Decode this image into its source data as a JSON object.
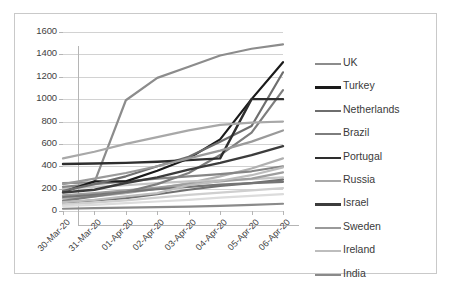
{
  "chart_data": {
    "type": "line",
    "title": "",
    "xlabel": "",
    "ylabel": "",
    "ylim": [
      0,
      1600
    ],
    "ytick_step": 200,
    "grid": true,
    "legend_position": "right",
    "yticks": [
      "1600",
      "1400",
      "1200",
      "1000",
      "800",
      "600",
      "400",
      "200",
      "0"
    ],
    "categories": [
      "30-Mar-20",
      "31-Mar-20",
      "01-Apr-20",
      "02-Apr-20",
      "03-Apr-20",
      "04-Apr-20",
      "05-Apr-20",
      "06-Apr-20"
    ],
    "series": [
      {
        "name": "UK",
        "color": "#8c8c8c",
        "width": 2.2,
        "values": [
          250,
          255,
          990,
          1190,
          1290,
          1390,
          1450,
          1490
        ]
      },
      {
        "name": "Turkey",
        "color": "#1a1a1a",
        "width": 2.2,
        "values": [
          170,
          265,
          265,
          360,
          470,
          640,
          1000,
          1330
        ]
      },
      {
        "name": "Netherlands",
        "color": "#6e6e6e",
        "width": 2.2,
        "values": [
          180,
          240,
          310,
          400,
          485,
          620,
          760,
          1240
        ]
      },
      {
        "name": "Brazil",
        "color": "#7d7d7d",
        "width": 2.2,
        "values": [
          90,
          130,
          170,
          240,
          340,
          500,
          700,
          1080
        ]
      },
      {
        "name": "Portugal",
        "color": "#2e2e2e",
        "width": 2.4,
        "values": [
          420,
          425,
          430,
          440,
          455,
          470,
          1000,
          1000
        ]
      },
      {
        "name": "Russia",
        "color": "#a8a8a8",
        "width": 2.2,
        "values": [
          470,
          530,
          600,
          660,
          720,
          770,
          790,
          800
        ]
      },
      {
        "name": "Israel",
        "color": "#3c3c3c",
        "width": 2.4,
        "values": [
          165,
          190,
          250,
          300,
          370,
          430,
          500,
          580
        ]
      },
      {
        "name": "Sweden",
        "color": "#9a9a9a",
        "width": 2.2,
        "values": [
          240,
          290,
          340,
          400,
          470,
          540,
          620,
          720
        ]
      },
      {
        "name": "Ireland",
        "color": "#bdbdbd",
        "width": 2.2,
        "values": [
          80,
          100,
          130,
          160,
          230,
          270,
          320,
          390
        ]
      },
      {
        "name": "India",
        "color": "#8a8a8a",
        "width": 2.2,
        "values": [
          20,
          25,
          30,
          35,
          40,
          45,
          55,
          65
        ]
      }
    ],
    "extra_series": [
      {
        "name": "series-11",
        "color": "#b0b0b0",
        "width": 2.2,
        "values": [
          110,
          130,
          160,
          200,
          250,
          310,
          380,
          470
        ]
      },
      {
        "name": "series-12",
        "color": "#c5c5c5",
        "width": 2.2,
        "values": [
          200,
          215,
          230,
          250,
          265,
          275,
          285,
          300
        ]
      },
      {
        "name": "series-13",
        "color": "#9e9e9e",
        "width": 2.2,
        "values": [
          140,
          160,
          185,
          210,
          240,
          265,
          290,
          345
        ]
      },
      {
        "name": "series-14",
        "color": "#707070",
        "width": 2.2,
        "values": [
          75,
          95,
          115,
          150,
          190,
          225,
          250,
          280
        ]
      },
      {
        "name": "series-15",
        "color": "#cfcfcf",
        "width": 2.2,
        "values": [
          60,
          75,
          95,
          120,
          145,
          165,
          185,
          205
        ]
      },
      {
        "name": "series-16",
        "color": "#868686",
        "width": 2.2,
        "values": [
          215,
          240,
          265,
          290,
          310,
          330,
          355,
          400
        ]
      },
      {
        "name": "series-17",
        "color": "#dcdcdc",
        "width": 2.2,
        "values": [
          45,
          55,
          70,
          85,
          100,
          120,
          135,
          150
        ]
      },
      {
        "name": "series-18",
        "color": "#757575",
        "width": 2.2,
        "values": [
          125,
          145,
          170,
          195,
          215,
          235,
          250,
          260
        ]
      }
    ]
  },
  "legend": {
    "items": [
      {
        "label": "UK"
      },
      {
        "label": "Turkey"
      },
      {
        "label": "Netherlands"
      },
      {
        "label": "Brazil"
      },
      {
        "label": "Portugal"
      },
      {
        "label": "Russia"
      },
      {
        "label": "Israel"
      },
      {
        "label": "Sweden"
      },
      {
        "label": "Ireland"
      },
      {
        "label": "India"
      }
    ]
  }
}
